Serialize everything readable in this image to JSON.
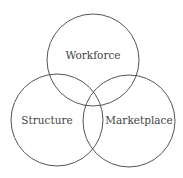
{
  "diagram": {
    "type": "venn",
    "sets": [
      {
        "label": "Workforce",
        "cx": 93,
        "cy": 60,
        "r": 46
      },
      {
        "label": "Structure",
        "cx": 57,
        "cy": 120,
        "r": 46
      },
      {
        "label": "Marketplace",
        "cx": 129,
        "cy": 121,
        "r": 46
      }
    ],
    "stroke_color": "#555555",
    "text_color": "#444444"
  }
}
